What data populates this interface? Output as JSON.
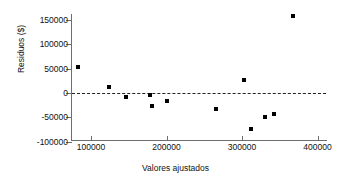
{
  "chart_data": {
    "type": "scatter",
    "title": "",
    "xlabel": "Valores ajustados",
    "ylabel": "Residuos ($)",
    "xlim": [
      70000,
      420000
    ],
    "ylim": [
      -100000,
      165000
    ],
    "xticks": [
      100000,
      200000,
      300000,
      400000
    ],
    "xtick_labels": [
      "100000",
      "200000",
      "300000",
      "400000"
    ],
    "yticks": [
      -100000,
      -50000,
      0,
      50000,
      100000,
      150000
    ],
    "ytick_labels": [
      "-100000",
      "-50000",
      "0",
      "50000",
      "100000",
      "150000"
    ],
    "grid": false,
    "legend": null,
    "reference_line": {
      "y": 0,
      "style": "dashed",
      "color": "#222222"
    },
    "marker": {
      "shape": "square",
      "color": "#000000",
      "size": 4
    },
    "points": [
      {
        "x": 83000,
        "y": 53000
      },
      {
        "x": 124000,
        "y": 12000
      },
      {
        "x": 147000,
        "y": -8000
      },
      {
        "x": 178000,
        "y": -5000
      },
      {
        "x": 181000,
        "y": -26000
      },
      {
        "x": 200000,
        "y": -17000
      },
      {
        "x": 265000,
        "y": -33000
      },
      {
        "x": 302000,
        "y": 27000
      },
      {
        "x": 312000,
        "y": -74000
      },
      {
        "x": 330000,
        "y": -50000
      },
      {
        "x": 343000,
        "y": -44000
      },
      {
        "x": 367000,
        "y": 157000
      }
    ]
  },
  "axis_titles": {
    "x": "Valores ajustados",
    "y": "Residuos ($)"
  }
}
